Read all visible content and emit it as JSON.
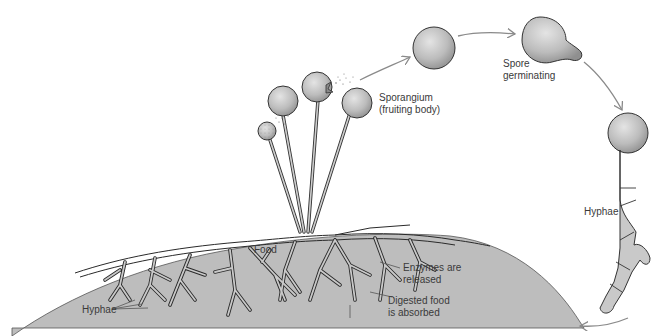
{
  "diagram": {
    "type": "life-cycle",
    "colors": {
      "substrate": "#bdbdbd",
      "hypha_fill": "#c9c9c9",
      "outline": "#2a2a2a",
      "arrow": "#8a8a8a",
      "text": "#3a3a3a",
      "background": "#ffffff"
    },
    "labels": {
      "sporangium": {
        "line1": "Sporangium",
        "line2": "(fruiting body)"
      },
      "spore_germinating": {
        "line1": "Spore",
        "line2": "germinating"
      },
      "hyphae_right": {
        "line1": "Hyphae"
      },
      "food": {
        "line1": "Food"
      },
      "hyphae_left": {
        "line1": "Hyphae"
      },
      "enzymes": {
        "line1": "Enzymes are",
        "line2": "released"
      },
      "digested": {
        "line1": "Digested food",
        "line2": "is absorbed"
      }
    },
    "stages": [
      {
        "id": "mycelium",
        "label": "Hyphae growing in food"
      },
      {
        "id": "sporangia",
        "label": "Sporangium (fruiting body)"
      },
      {
        "id": "spore",
        "label": "Released spore"
      },
      {
        "id": "germination",
        "label": "Spore germinating"
      },
      {
        "id": "new-hyphae",
        "label": "Hyphae"
      }
    ],
    "nodes": [
      {
        "id": "mycelium",
        "x": 330,
        "y": 280
      },
      {
        "id": "sporangia",
        "x": 320,
        "y": 120
      },
      {
        "id": "spore",
        "x": 434,
        "y": 48
      },
      {
        "id": "germination",
        "x": 540,
        "y": 40
      },
      {
        "id": "new-hyphae",
        "x": 620,
        "y": 250
      }
    ],
    "edges": [
      {
        "from": "sporangia",
        "to": "spore",
        "style": "arrow"
      },
      {
        "from": "spore",
        "to": "germination",
        "style": "arrow"
      },
      {
        "from": "germination",
        "to": "new-hyphae",
        "style": "arrow"
      },
      {
        "from": "new-hyphae",
        "to": "mycelium",
        "style": "arrow"
      }
    ]
  }
}
